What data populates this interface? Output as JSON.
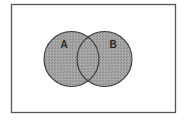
{
  "diagram": {
    "type": "venn",
    "universe": {
      "label": ""
    },
    "sets": [
      {
        "id": "A",
        "label": "A"
      },
      {
        "id": "B",
        "label": "B"
      }
    ],
    "shaded_region": "A ∪ B",
    "colors": {
      "border": "#555555",
      "circle_stroke": "#3a3a3a",
      "fill": "#9c9c9c",
      "label": "#2a2a2a",
      "background": "#ffffff"
    }
  }
}
